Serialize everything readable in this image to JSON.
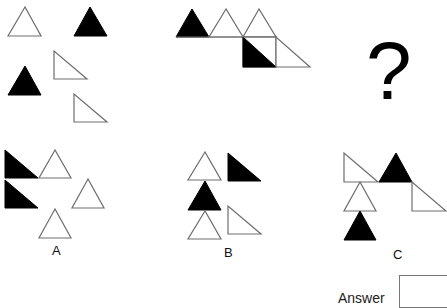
{
  "puzzle": {
    "question_mark": "?",
    "answer_label": "Answer",
    "options": [
      {
        "id": "A",
        "label": "A"
      },
      {
        "id": "B",
        "label": "B"
      },
      {
        "id": "C",
        "label": "C"
      }
    ]
  },
  "colors": {
    "fill_black": "#000000",
    "fill_white": "#ffffff",
    "stroke": "#6e6e6e"
  },
  "figures": {
    "figure_1": [
      {
        "type": "equilateral",
        "fill": "white",
        "points": "25,7 8,36 41,36"
      },
      {
        "type": "equilateral",
        "fill": "black",
        "points": "90,7 74,36 107,36"
      },
      {
        "type": "equilateral",
        "fill": "black",
        "points": "25,66 8,95 41,95"
      },
      {
        "type": "right",
        "fill": "white",
        "points": "54,51 54,79 87,79"
      },
      {
        "type": "right",
        "fill": "white",
        "points": "74,94 74,122 107,122"
      }
    ],
    "figure_2": [
      {
        "type": "equilateral",
        "fill": "black",
        "points": "192,9 176,37 209,37"
      },
      {
        "type": "equilateral",
        "fill": "white",
        "points": "226,9 209,37 243,37"
      },
      {
        "type": "equilateral",
        "fill": "white",
        "points": "259,9 243,37 276,37"
      },
      {
        "type": "square",
        "fill": "white",
        "points": "243,37 276,37 276,67 243,67"
      },
      {
        "type": "right",
        "fill": "black",
        "points": "243,37 243,67 276,67"
      },
      {
        "type": "right",
        "fill": "white",
        "points": "276,37 276,67 310,67"
      }
    ],
    "option_A": [
      {
        "type": "right",
        "fill": "black",
        "points": "5,150 5,178 38,178"
      },
      {
        "type": "right",
        "fill": "black",
        "points": "5,180 5,208 38,208"
      },
      {
        "type": "equilateral",
        "fill": "white",
        "points": "55,150 39,178 71,178"
      },
      {
        "type": "equilateral",
        "fill": "white",
        "points": "88,179 72,208 104,208"
      },
      {
        "type": "equilateral",
        "fill": "white",
        "points": "55,209 39,238 71,238"
      }
    ],
    "option_B": [
      {
        "type": "equilateral",
        "fill": "white",
        "points": "205,152 188,180 221,180"
      },
      {
        "type": "right",
        "fill": "black",
        "points": "228,153 228,181 261,181"
      },
      {
        "type": "equilateral",
        "fill": "black",
        "points": "205,181 188,210 221,210"
      },
      {
        "type": "equilateral",
        "fill": "white",
        "points": "205,211 188,239 221,239"
      },
      {
        "type": "right",
        "fill": "white",
        "points": "228,206 228,234 261,234"
      }
    ],
    "option_C": [
      {
        "type": "right",
        "fill": "white",
        "points": "344,153 344,182 378,182"
      },
      {
        "type": "equilateral",
        "fill": "black",
        "points": "396,153 379,182 412,182"
      },
      {
        "type": "right",
        "fill": "white",
        "points": "412,182 412,211 446,211"
      },
      {
        "type": "equilateral",
        "fill": "white",
        "points": "360,182 344,211 376,211"
      },
      {
        "type": "equilateral",
        "fill": "black",
        "points": "360,211 344,240 376,240"
      }
    ]
  }
}
